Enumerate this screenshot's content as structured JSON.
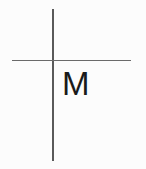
{
  "figure": {
    "background_color": "#fcfcfc",
    "width": 146,
    "height": 169
  },
  "axes": {
    "vertical": {
      "name": "vertical-axis",
      "color": "#5a5a5a",
      "x": 52,
      "y_start": 9,
      "y_end": 161,
      "thickness": 1.6
    },
    "horizontal": {
      "name": "horizontal-axis",
      "color": "#6a6a6a",
      "y": 60,
      "x_start": 12,
      "x_end": 131,
      "thickness": 1.5
    },
    "intersection": {
      "x": 52,
      "y": 60
    }
  },
  "labels": {
    "quadrant_letter": "M",
    "quadrant_letter_color": "#1a1a1a",
    "quadrant_letter_x": 63,
    "quadrant_letter_y": 73
  },
  "chart_data": {
    "type": "line",
    "title": "",
    "xlabel": "",
    "ylabel": "",
    "grid": false,
    "legend": "none",
    "annotations": [
      {
        "text": "M",
        "x": 63,
        "y": 85,
        "quadrant": "lower-right",
        "color": "#1a1a1a"
      }
    ],
    "series": [
      {
        "name": "vertical-axis",
        "x": [
          52,
          52
        ],
        "y": [
          9,
          161
        ],
        "color": "#5a5a5a"
      },
      {
        "name": "horizontal-axis",
        "x": [
          12,
          131
        ],
        "y": [
          60,
          60
        ],
        "color": "#6a6a6a"
      }
    ]
  }
}
